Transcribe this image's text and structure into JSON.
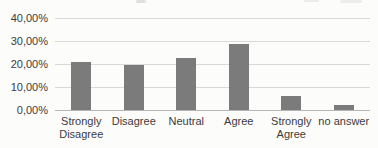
{
  "page": {
    "background": "#fcfcfb"
  },
  "chart_data": {
    "type": "bar",
    "title": "",
    "xlabel": "",
    "ylabel": "",
    "categories": [
      "Strongly Disagree",
      "Disagree",
      "Neutral",
      "Agree",
      "Strongly Agree",
      "no answer"
    ],
    "values": [
      21.0,
      19.5,
      22.5,
      29.0,
      6.0,
      2.0
    ],
    "value_unit": "percent",
    "ylim": [
      0,
      40
    ],
    "yticks": [
      {
        "value": 0,
        "label": "0,00%"
      },
      {
        "value": 10,
        "label": "10,00%"
      },
      {
        "value": 20,
        "label": "20,00%"
      },
      {
        "value": 30,
        "label": "30,00%"
      },
      {
        "value": 40,
        "label": "40,00%"
      }
    ],
    "grid": true,
    "legend": false,
    "colors": {
      "bar": "#7b7b7b",
      "gridline": "#d9d9d9",
      "axis_line": "#b5b5b5",
      "text": "#3b3b3b",
      "background": "#fcfcfb"
    },
    "layout": {
      "plot_left": 55,
      "plot_right": 370,
      "baseline_y": 110,
      "top_y": 18.4,
      "bar_width": 20,
      "xlabel_top": 115
    }
  }
}
